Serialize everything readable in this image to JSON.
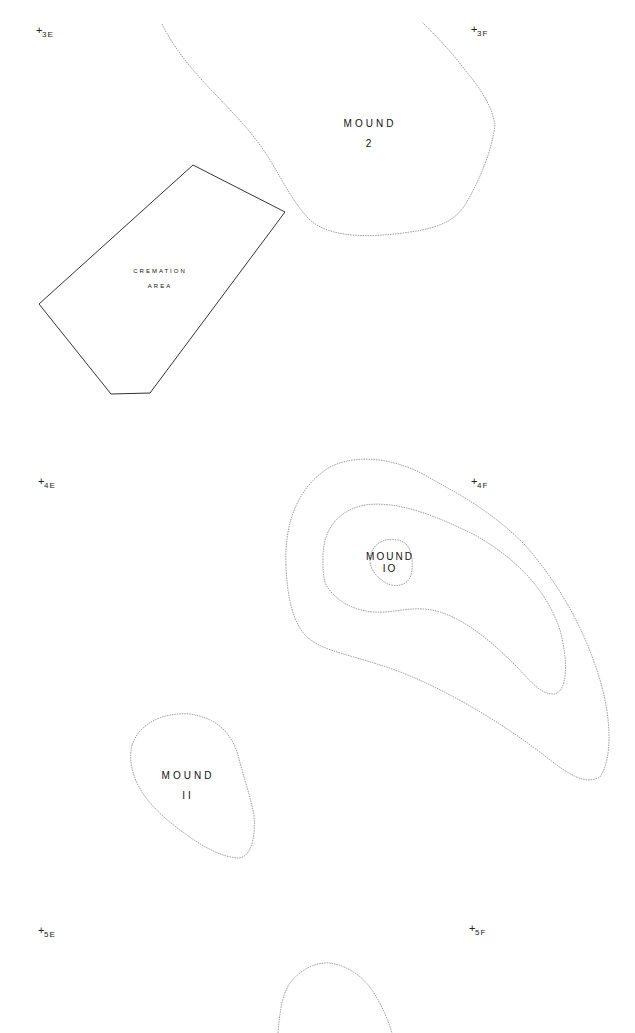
{
  "map": {
    "background": "#ffffff",
    "line_color": "#8a8a8a",
    "grid_markers": [
      {
        "id": "3E",
        "label": "3E",
        "x": 36,
        "y": 30
      },
      {
        "id": "3F",
        "label": "3F",
        "x": 473,
        "y": 27
      },
      {
        "id": "4E",
        "label": "4E",
        "x": 38,
        "y": 479
      },
      {
        "id": "4F",
        "label": "4F",
        "x": 473,
        "y": 478
      },
      {
        "id": "5E",
        "label": "5E",
        "x": 40,
        "y": 928
      },
      {
        "id": "5F",
        "label": "5F",
        "x": 470,
        "y": 926
      }
    ],
    "features": {
      "mound_2": {
        "line1": "MOUND",
        "line2": "2"
      },
      "cremation_area": {
        "line1": "CREMATION",
        "line2": "AREA"
      },
      "mound_10": {
        "line1": "MOUND",
        "line2": "IO"
      },
      "mound_11": {
        "line1": "MOUND",
        "line2": "II"
      }
    }
  }
}
